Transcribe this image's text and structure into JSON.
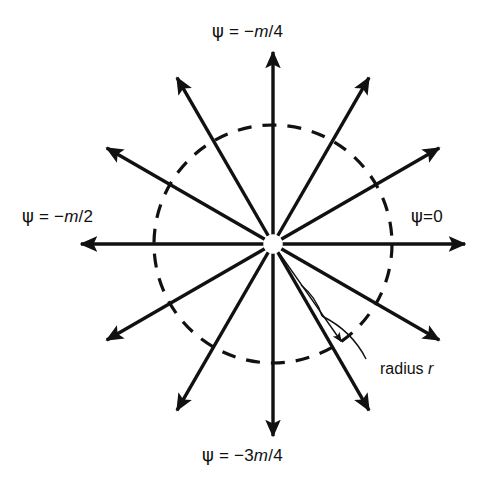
{
  "figure": {
    "type": "polar-ray-diagram",
    "background_color": "#ffffff",
    "ink_color": "#111111",
    "center": {
      "x": 273,
      "y": 244
    },
    "dashed_circle": {
      "radius": 119,
      "dash_pattern": "14 11",
      "stroke_width": 3.2
    },
    "rays": {
      "count": 12,
      "angle_step_deg": 30,
      "length": 192,
      "stroke_width": 3.4,
      "arrowhead": true,
      "angles_deg": [
        0,
        30,
        60,
        90,
        120,
        150,
        180,
        210,
        240,
        270,
        300,
        330
      ]
    },
    "radius_annotation": {
      "line_angle_deg": -55,
      "line_length": 119,
      "stroke_width": 1.4,
      "arrowhead": true,
      "leader_curve": true
    }
  },
  "labels": {
    "top": {
      "psi": "ψ",
      "eq": " = −",
      "var": "m",
      "frac": "/4"
    },
    "left": {
      "psi": "ψ",
      "eq": " = −",
      "var": "m",
      "frac": "/2"
    },
    "right": {
      "psi": "ψ",
      "eq": "=",
      "var": "",
      "frac": "0"
    },
    "bottom": {
      "psi": "ψ",
      "eq": " = −3",
      "var": "m",
      "frac": "/4"
    },
    "radius": {
      "text": "radius ",
      "var": "r"
    }
  },
  "label_text": {
    "top_full": "ψ = −m/4",
    "left_full": "ψ = −m/2",
    "right_full": "ψ=0",
    "bottom_full": "ψ = −3m/4",
    "radius_full": "radius r"
  }
}
